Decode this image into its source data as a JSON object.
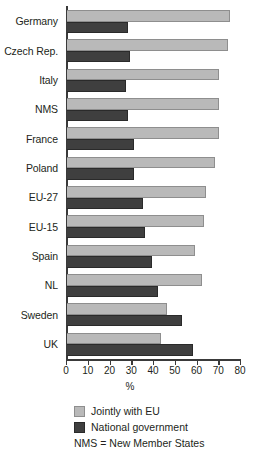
{
  "chart_data": {
    "type": "bar",
    "orientation": "horizontal",
    "title": "",
    "xlabel": "%",
    "ylabel": "",
    "xlim": [
      0,
      80
    ],
    "xticks": [
      0,
      10,
      20,
      30,
      40,
      50,
      60,
      70,
      80
    ],
    "grid": false,
    "legend_position": "bottom-left",
    "categories": [
      "Germany",
      "Czech Rep.",
      "Italy",
      "NMS",
      "France",
      "Poland",
      "EU-27",
      "EU-15",
      "Spain",
      "NL",
      "Sweden",
      "UK"
    ],
    "series": [
      {
        "name": "Jointly with EU",
        "color": "#b9b9b9",
        "values": [
          75,
          74,
          70,
          70,
          70,
          68,
          64,
          63,
          59,
          62,
          46,
          43
        ]
      },
      {
        "name": "National government",
        "color": "#3f3f3f",
        "values": [
          28,
          29,
          27,
          28,
          31,
          31,
          35,
          36,
          39,
          42,
          53,
          58
        ]
      }
    ],
    "note": "NMS = New Member States"
  },
  "axis": {
    "tick_labels": [
      "0",
      "10",
      "20",
      "30",
      "40",
      "50",
      "60",
      "70",
      "80"
    ],
    "x_title": "%"
  },
  "legend": {
    "items": [
      {
        "label": "Jointly with EU"
      },
      {
        "label": "National government"
      }
    ],
    "note": "NMS = New Member States"
  }
}
